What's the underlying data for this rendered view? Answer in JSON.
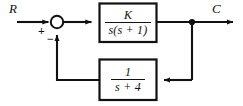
{
  "diagram": {
    "type": "control-system-block-diagram",
    "background_color": "#ffffff",
    "line_color": "#111111",
    "width": 243,
    "height": 106
  },
  "signals": {
    "input_label": "R",
    "output_label": "C"
  },
  "summing_junction": {
    "name": "summing-junction",
    "shape": "circle",
    "input_sign": "+",
    "feedback_sign": "−"
  },
  "blocks": [
    {
      "id": "forward-block",
      "role": "forward-path",
      "numerator": "K",
      "denominator": "s(s + 1)",
      "transfer_function": "K / [s(s + 1)]"
    },
    {
      "id": "feedback-block",
      "role": "feedback-path",
      "numerator": "1",
      "denominator": "s + 4",
      "transfer_function": "1 / (s + 4)"
    }
  ],
  "nodes": {
    "takeoff_point": "output-takeoff-node"
  }
}
